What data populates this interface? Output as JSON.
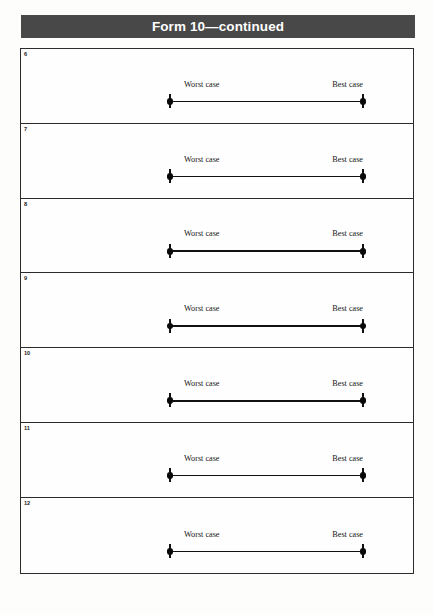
{
  "header": {
    "title": "Form 10—continued"
  },
  "table": {
    "rows": [
      {
        "number": "6",
        "worst_label": "Worst case",
        "best_label": "Best case"
      },
      {
        "number": "7",
        "worst_label": "Worst case",
        "best_label": "Best case"
      },
      {
        "number": "8",
        "worst_label": "Worst case",
        "best_label": "Best case"
      },
      {
        "number": "9",
        "worst_label": "Worst case",
        "best_label": "Best case"
      },
      {
        "number": "10",
        "worst_label": "Worst case",
        "best_label": "Best case"
      },
      {
        "number": "11",
        "worst_label": "Worst case",
        "best_label": "Best case"
      },
      {
        "number": "12",
        "worst_label": "Worst case",
        "best_label": "Best case"
      }
    ]
  },
  "colors": {
    "header_background": "#484848",
    "header_text": "#ffffff",
    "border": "#2b2b2b",
    "line": "#111111",
    "page_background": "#fdfdfc"
  }
}
